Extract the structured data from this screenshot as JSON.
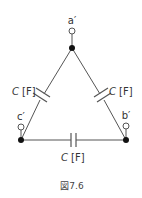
{
  "diagram": {
    "type": "delta-connected capacitors",
    "nodes": {
      "top": {
        "terminal_label": "a′"
      },
      "right": {
        "terminal_label": "b′"
      },
      "left": {
        "terminal_label": "c′"
      }
    },
    "capacitors": {
      "left": {
        "label_var": "C",
        "label_unit": "[F]"
      },
      "right": {
        "label_var": "C",
        "label_unit": "[F]"
      },
      "bottom": {
        "label_var": "C",
        "label_unit": "[F]"
      }
    },
    "caption": "図7.6",
    "colors": {
      "line": "#555555",
      "dot": "#111111",
      "text": "#333333"
    }
  }
}
